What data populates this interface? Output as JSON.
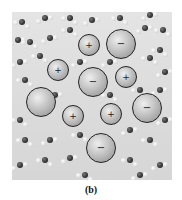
{
  "figure": {
    "label": "(b)",
    "background_color": "#dcdcdc",
    "ions": [
      {
        "sign": "+",
        "x": 89,
        "y": 45,
        "r": 11
      },
      {
        "sign": "−",
        "x": 121,
        "y": 44,
        "r": 15
      },
      {
        "sign": "+",
        "x": 58,
        "y": 70,
        "r": 11
      },
      {
        "sign": "−",
        "x": 93,
        "y": 82,
        "r": 15
      },
      {
        "sign": "+",
        "x": 126,
        "y": 77,
        "r": 11
      },
      {
        "sign": "",
        "x": 41,
        "y": 102,
        "r": 15
      },
      {
        "sign": "−",
        "x": 147,
        "y": 108,
        "r": 15
      },
      {
        "sign": "+",
        "x": 73,
        "y": 116,
        "r": 11
      },
      {
        "sign": "+",
        "x": 111,
        "y": 114,
        "r": 11
      },
      {
        "sign": "−",
        "x": 101,
        "y": 148,
        "r": 15
      }
    ],
    "water": [
      [
        22,
        22
      ],
      [
        45,
        18
      ],
      [
        70,
        18
      ],
      [
        92,
        20
      ],
      [
        120,
        18
      ],
      [
        150,
        15
      ],
      [
        163,
        30
      ],
      [
        18,
        40
      ],
      [
        30,
        42
      ],
      [
        50,
        38
      ],
      [
        70,
        30
      ],
      [
        145,
        28
      ],
      [
        160,
        50
      ],
      [
        20,
        62
      ],
      [
        40,
        56
      ],
      [
        110,
        62
      ],
      [
        150,
        58
      ],
      [
        165,
        72
      ],
      [
        25,
        80
      ],
      [
        80,
        62
      ],
      [
        140,
        90
      ],
      [
        160,
        90
      ],
      [
        20,
        120
      ],
      [
        55,
        95
      ],
      [
        110,
        95
      ],
      [
        165,
        120
      ],
      [
        25,
        140
      ],
      [
        50,
        140
      ],
      [
        80,
        135
      ],
      [
        130,
        130
      ],
      [
        150,
        140
      ],
      [
        20,
        165
      ],
      [
        45,
        160
      ],
      [
        70,
        158
      ],
      [
        130,
        160
      ],
      [
        160,
        165
      ],
      [
        85,
        175
      ],
      [
        140,
        175
      ]
    ]
  }
}
